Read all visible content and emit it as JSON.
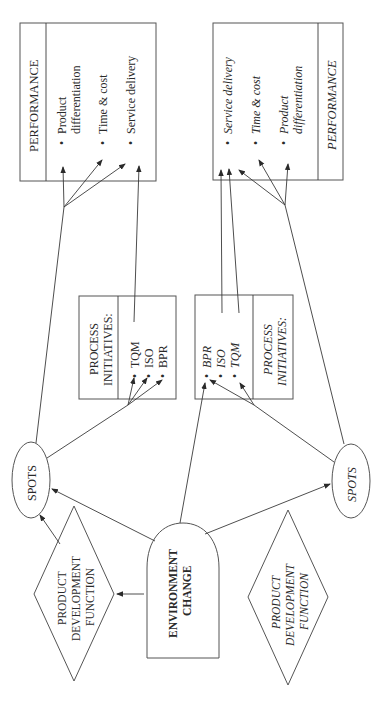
{
  "colors": {
    "stroke": "#555555",
    "text": "#2a2a2a",
    "background": "#ffffff"
  },
  "left": {
    "performance": {
      "title": "PERFORMANCE",
      "items": [
        "Product",
        "differentiation",
        "Time & cost",
        "Service delivery"
      ]
    },
    "process": {
      "title_line1": "PROCESS",
      "title_line2": "INITIATIVES:",
      "items": [
        "TQM",
        "ISO",
        "BPR"
      ]
    },
    "spots": "SPOTS",
    "product_dev": {
      "line1": "PRODUCT",
      "line2": "DEVELOPMENT",
      "line3": "FUNCTION"
    }
  },
  "right": {
    "performance": {
      "title": "PERFORMANCE",
      "items": [
        "Service delivery",
        "Time & cost",
        "Product",
        "differentiation"
      ]
    },
    "process": {
      "title_line1": "PROCESS",
      "title_line2": "INITIATIVES:",
      "items": [
        "BPR",
        "ISO",
        "TQM"
      ]
    },
    "spots": "SPOTS",
    "product_dev": {
      "line1": "PRODUCT",
      "line2": "DEVELOPMENT",
      "line3": "FUNCTION"
    }
  },
  "environment": {
    "line1": "ENVIRONMENT",
    "line2": "CHANGE"
  },
  "bullet": "•"
}
